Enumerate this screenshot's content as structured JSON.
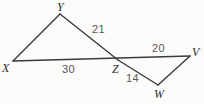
{
  "figure": {
    "kind": "geometry-diagram",
    "canvas": {
      "width": 204,
      "height": 104
    },
    "background_color": "#fbfbf9",
    "stroke_color": "#3a3a3a",
    "stroke_width": 1.4,
    "vertex_label_color": "#2e2e2e",
    "side_label_color": "#585858",
    "points": [
      {
        "name": "X",
        "label": "X",
        "x": 13,
        "y": 61
      },
      {
        "name": "Y",
        "label": "Y",
        "x": 60,
        "y": 14
      },
      {
        "name": "Z",
        "label": "Z",
        "x": 118,
        "y": 60
      },
      {
        "name": "V",
        "label": "V",
        "x": 190,
        "y": 56
      },
      {
        "name": "W",
        "label": "W",
        "x": 158,
        "y": 85
      }
    ],
    "vertex_labels": [
      {
        "name": "vertex-label-Y",
        "text": "Y",
        "x": 57,
        "y": 1
      },
      {
        "name": "vertex-label-X",
        "text": "X",
        "x": 2,
        "y": 62
      },
      {
        "name": "vertex-label-Z",
        "text": "Z",
        "x": 112,
        "y": 63
      },
      {
        "name": "vertex-label-V",
        "text": "V",
        "x": 192,
        "y": 46
      },
      {
        "name": "vertex-label-W",
        "text": "W",
        "x": 154,
        "y": 88
      }
    ],
    "segments": [
      {
        "name": "segment-X-V",
        "from": "X",
        "to": "V"
      },
      {
        "name": "segment-X-Y",
        "from": "X",
        "to": "Y"
      },
      {
        "name": "segment-Y-Z",
        "from": "Y",
        "to": "Z"
      },
      {
        "name": "segment-Z-W",
        "from": "Z",
        "to": "W"
      },
      {
        "name": "segment-W-V",
        "from": "W",
        "to": "V"
      }
    ],
    "side_labels": [
      {
        "name": "side-length-YZ",
        "text": "21",
        "x": 92,
        "y": 24,
        "for_segment": "segment-Y-Z"
      },
      {
        "name": "side-length-XZ",
        "text": "30",
        "x": 62,
        "y": 64,
        "for_segment": "segment-X-V"
      },
      {
        "name": "side-length-ZV",
        "text": "20",
        "x": 152,
        "y": 43,
        "for_segment": "segment-X-V"
      },
      {
        "name": "side-length-ZW",
        "text": "14",
        "x": 126,
        "y": 73,
        "for_segment": "segment-Z-W"
      }
    ]
  }
}
